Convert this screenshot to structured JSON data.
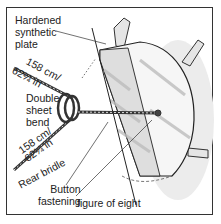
{
  "diagram": {
    "labels": {
      "plate": [
        "Hardened",
        "synthetic",
        "plate"
      ],
      "upper_length_cm": "158 cm/",
      "upper_length_in": "62¼ in",
      "knot": [
        "Double",
        "sheet",
        "bend"
      ],
      "lower_length_cm": "158 cm/",
      "lower_length_in": "62¼ in",
      "bridle": "Rear bridle",
      "fastening": [
        "Button",
        "fastening"
      ],
      "figure": "figure of eight"
    },
    "colors": {
      "frame": "#333333",
      "ink": "#222222",
      "plate_shade": "#d9d9d9",
      "background": "#ffffff"
    }
  }
}
